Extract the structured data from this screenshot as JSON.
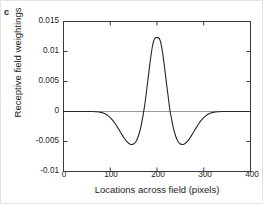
{
  "panel": {
    "label": "c"
  },
  "chart_data": {
    "type": "line",
    "title": "",
    "subtitle": "",
    "xlabel": "Locations across field (pixels)",
    "ylabel": "Receptive field weightings",
    "xlim": [
      0,
      400
    ],
    "ylim": [
      -0.01,
      0.015
    ],
    "xticks": [
      0,
      100,
      200,
      300,
      400
    ],
    "xtick_labels": [
      "0",
      "100",
      "200",
      "300",
      "400"
    ],
    "yticks": [
      -0.01,
      -0.005,
      0,
      0.005,
      0.01,
      0.015
    ],
    "ytick_labels": [
      "-0.01",
      "-0.005",
      "0",
      "0.005",
      "0.01",
      "0.015"
    ],
    "grid": false,
    "legend": null,
    "zero_reference_line": {
      "y": 0,
      "color": "#9a9a9a"
    },
    "line_color": "#262626",
    "series": [
      {
        "name": "Receptive field weighting profile",
        "x": [
          0,
          10,
          20,
          30,
          40,
          50,
          60,
          70,
          75,
          80,
          85,
          90,
          95,
          100,
          105,
          110,
          115,
          120,
          125,
          130,
          135,
          140,
          142,
          145,
          150,
          155,
          160,
          165,
          170,
          172,
          175,
          180,
          185,
          190,
          195,
          200,
          205,
          210,
          215,
          220,
          225,
          228,
          230,
          235,
          240,
          245,
          250,
          255,
          258,
          260,
          265,
          270,
          275,
          280,
          285,
          290,
          295,
          300,
          305,
          310,
          315,
          320,
          325,
          330,
          340,
          350,
          360,
          370,
          380,
          390,
          400
        ],
        "y": [
          0.0,
          0.0,
          0.0,
          0.0,
          0.0,
          0.0,
          -1e-05,
          -4e-05,
          -8e-05,
          -0.00015,
          -0.00026,
          -0.00043,
          -0.00068,
          -0.00101,
          -0.00144,
          -0.00196,
          -0.00256,
          -0.0032,
          -0.00385,
          -0.00445,
          -0.00497,
          -0.00534,
          -0.00543,
          -0.00551,
          -0.00543,
          -0.005,
          -0.00412,
          -0.00272,
          -0.00075,
          0.00022,
          0.0018,
          0.0049,
          0.0081,
          0.01075,
          0.01215,
          0.0123,
          0.01215,
          0.01075,
          0.0081,
          0.0049,
          0.0018,
          0.0,
          -0.00075,
          -0.00272,
          -0.00412,
          -0.005,
          -0.00543,
          -0.00551,
          -0.00543,
          -0.00534,
          -0.00497,
          -0.00445,
          -0.00385,
          -0.0032,
          -0.00256,
          -0.00196,
          -0.00144,
          -0.00101,
          -0.00068,
          -0.00043,
          -0.00026,
          -0.00015,
          -8e-05,
          -4e-05,
          -1e-05,
          0.0,
          0.0,
          0.0,
          0.0,
          0.0,
          0.0
        ]
      }
    ],
    "annotations": {
      "peak": {
        "x": 200,
        "y": 0.0123
      },
      "left_trough": {
        "x": 143,
        "y": -0.0055
      },
      "right_trough": {
        "x": 257,
        "y": -0.0055
      }
    }
  }
}
